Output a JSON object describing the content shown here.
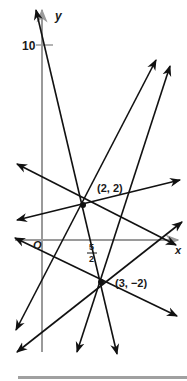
{
  "figure": {
    "axes": {
      "x_label": "x",
      "y_label": "y",
      "origin_label": "O",
      "y_tick_label": "10",
      "x_tick_label_num": "5",
      "x_tick_label_den": "2",
      "axis_color": "#9a9a9a"
    },
    "points": [
      {
        "label": "(2, 2)",
        "x": 2,
        "y": 2
      },
      {
        "label": "(3, −2)",
        "x": 3,
        "y": -2
      }
    ],
    "line_color": "#111111",
    "footer_rule_color": "#a0a0a0"
  }
}
